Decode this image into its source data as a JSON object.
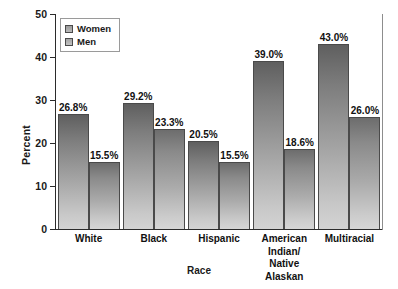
{
  "chart_data": {
    "type": "bar",
    "title": "",
    "xlabel": "Race",
    "ylabel": "Percent",
    "ylim": [
      0,
      50
    ],
    "yticks": [
      0,
      10,
      20,
      30,
      40,
      50
    ],
    "grid": false,
    "legend_position": "top-left",
    "categories": [
      "White",
      "Black",
      "Hispanic",
      "American Indian/\nNative Alaskan",
      "Multiracial"
    ],
    "category_lines": [
      [
        "White"
      ],
      [
        "Black"
      ],
      [
        "Hispanic"
      ],
      [
        "American Indian/",
        "Native Alaskan"
      ],
      [
        "Multiracial"
      ]
    ],
    "series": [
      {
        "name": "Women",
        "values": [
          26.8,
          29.2,
          20.5,
          39.0,
          43.0
        ],
        "labels": [
          "26.8%",
          "29.2%",
          "20.5%",
          "39.0%",
          "43.0%"
        ],
        "color_top": "#5f5f5f",
        "color_bottom": "#d3d3d3"
      },
      {
        "name": "Men",
        "values": [
          15.5,
          23.3,
          15.5,
          18.6,
          26.0
        ],
        "labels": [
          "15.5%",
          "23.3%",
          "15.5%",
          "18.6%",
          "26.0%"
        ],
        "color_top": "#6d6d6d",
        "color_bottom": "#d6d6d6"
      }
    ]
  },
  "axis": {
    "y_tick_labels": [
      "50",
      "40",
      "30",
      "20",
      "10",
      "0"
    ],
    "y_title": "Percent",
    "x_title": "Race"
  },
  "legend": {
    "items": [
      {
        "label": "Women"
      },
      {
        "label": "Men"
      }
    ]
  },
  "colors": {
    "axis": "#2b2b2b",
    "frame": "#8d8d8d",
    "text": "#1a1a1a",
    "bar_border": "#4a4a4a"
  }
}
